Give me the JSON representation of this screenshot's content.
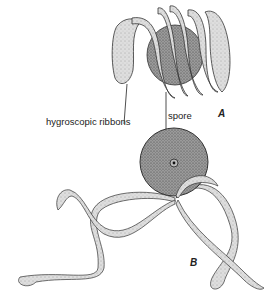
{
  "figure": {
    "labels": {
      "ribbons": "hygroscopic ribbons",
      "spore": "spore",
      "panel_a": "A",
      "panel_b": "B"
    },
    "colors": {
      "ink": "#222222",
      "ribbon_fill": "#d9d9d9",
      "spore_fill": "#8a8a8a",
      "background": "#ffffff"
    }
  }
}
